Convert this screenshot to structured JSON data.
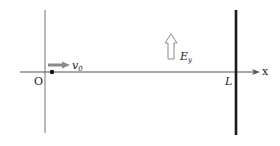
{
  "diagram": {
    "origin_label": "O",
    "x_axis_label": "x",
    "velocity_label": "v",
    "velocity_subscript": "0",
    "field_label": "E",
    "field_subscript": "y",
    "wall_label": "L",
    "colors": {
      "axis": "#777777",
      "wall": "#1a1a1a",
      "velocity_arrow": "#8a8a8a",
      "field_arrow_stroke": "#777777",
      "particle": "#111111"
    }
  }
}
